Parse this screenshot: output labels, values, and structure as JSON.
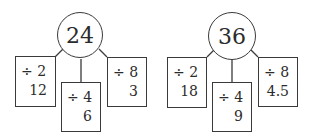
{
  "diagrams": [
    {
      "root": "24",
      "branches": [
        {
          "operation": "÷ 2",
          "result": "12"
        },
        {
          "operation": "÷ 4",
          "result": "6"
        },
        {
          "operation": "÷ 8",
          "result": "3"
        }
      ]
    },
    {
      "root": "36",
      "branches": [
        {
          "operation": "÷ 2",
          "result": "18"
        },
        {
          "operation": "÷ 4",
          "result": "9"
        },
        {
          "operation": "÷ 8",
          "result": "4.5"
        }
      ]
    }
  ]
}
